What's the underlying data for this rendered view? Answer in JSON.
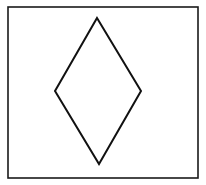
{
  "canvas": {
    "width": 206,
    "height": 185,
    "background": "#ffffff"
  },
  "frame": {
    "x": 8,
    "y": 7,
    "width": 190,
    "height": 171,
    "stroke": "#1a1a1a",
    "stroke_width": 1.6
  },
  "diamond": {
    "points": "97,18 141,91 99,164 55,91",
    "stroke": "#111111",
    "stroke_width": 2,
    "fill": "none"
  }
}
